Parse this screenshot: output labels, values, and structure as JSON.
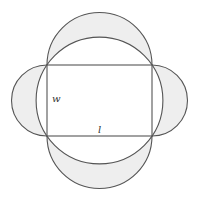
{
  "diagram": {
    "labels": {
      "width": "w",
      "length": "l"
    },
    "colors": {
      "stroke": "#555555",
      "lune_fill": "#eeeeee",
      "background": "#ffffff"
    },
    "shapes": {
      "rectangle": {
        "x": 47,
        "y": 65,
        "width": 105,
        "height": 71
      },
      "circumcircle": {
        "cx": 99.5,
        "cy": 100.5,
        "r": 63.4
      },
      "semicircles": [
        {
          "side": "top",
          "r": 52.5
        },
        {
          "side": "bottom",
          "r": 52.5
        },
        {
          "side": "left",
          "r": 35.5
        },
        {
          "side": "right",
          "r": 35.5
        }
      ]
    }
  }
}
